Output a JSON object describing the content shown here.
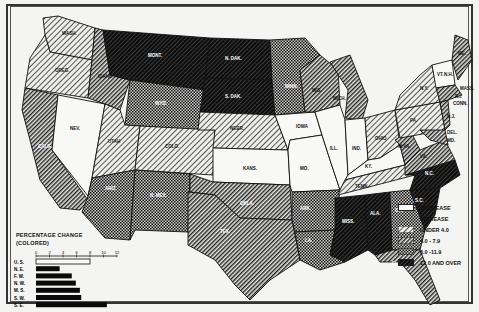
{
  "map": {
    "subject": "United States percentage change by state",
    "states": [
      {
        "abbr": "WASH.",
        "category": "under_4"
      },
      {
        "abbr": "OREG.",
        "category": "under_4"
      },
      {
        "abbr": "CALIF.",
        "category": "4_to_7.9"
      },
      {
        "abbr": "NEV.",
        "category": "decrease"
      },
      {
        "abbr": "IDAHO",
        "category": "4_to_7.9"
      },
      {
        "abbr": "MONT.",
        "category": "12_and_over"
      },
      {
        "abbr": "WYO.",
        "category": "8_to_11.9"
      },
      {
        "abbr": "UTAH",
        "category": "under_4"
      },
      {
        "abbr": "COLO.",
        "category": "under_4"
      },
      {
        "abbr": "ARIZ.",
        "category": "8_to_11.9"
      },
      {
        "abbr": "N. MEX.",
        "category": "8_to_11.9"
      },
      {
        "abbr": "N. DAK.",
        "category": "12_and_over"
      },
      {
        "abbr": "S. DAK.",
        "category": "12_and_over"
      },
      {
        "abbr": "NEBR.",
        "category": "under_4"
      },
      {
        "abbr": "KANS.",
        "category": "decrease"
      },
      {
        "abbr": "OKLA.",
        "category": "4_to_7.9"
      },
      {
        "abbr": "TEX.",
        "category": "4_to_7.9"
      },
      {
        "abbr": "MINN.",
        "category": "8_to_11.9"
      },
      {
        "abbr": "IOWA",
        "category": "decrease"
      },
      {
        "abbr": "MO.",
        "category": "decrease"
      },
      {
        "abbr": "ARK.",
        "category": "8_to_11.9"
      },
      {
        "abbr": "LA.",
        "category": "8_to_11.9"
      },
      {
        "abbr": "WIS.",
        "category": "4_to_7.9"
      },
      {
        "abbr": "ILL.",
        "category": "decrease"
      },
      {
        "abbr": "MICH.",
        "category": "4_to_7.9"
      },
      {
        "abbr": "IND.",
        "category": "decrease"
      },
      {
        "abbr": "OHIO",
        "category": "under_4"
      },
      {
        "abbr": "KY.",
        "category": "decrease"
      },
      {
        "abbr": "TENN.",
        "category": "under_4"
      },
      {
        "abbr": "MISS.",
        "category": "12_and_over"
      },
      {
        "abbr": "ALA.",
        "category": "12_and_over"
      },
      {
        "abbr": "GA.",
        "category": "8_to_11.9"
      },
      {
        "abbr": "FLA.",
        "category": "4_to_7.9"
      },
      {
        "abbr": "S.C.",
        "category": "12_and_over"
      },
      {
        "abbr": "N.C.",
        "category": "12_and_over"
      },
      {
        "abbr": "VA.",
        "category": "4_to_7.9"
      },
      {
        "abbr": "W. VA.",
        "category": "4_to_7.9"
      },
      {
        "abbr": "PA.",
        "category": "under_4"
      },
      {
        "abbr": "N.Y.",
        "category": "under_4"
      },
      {
        "abbr": "N.J.",
        "category": "4_to_7.9"
      },
      {
        "abbr": "DEL.",
        "category": "4_to_7.9"
      },
      {
        "abbr": "MD.",
        "category": "4_to_7.9"
      },
      {
        "abbr": "VT.",
        "category": "decrease"
      },
      {
        "abbr": "N.H.",
        "category": "decrease"
      },
      {
        "abbr": "MAINE",
        "category": "4_to_7.9"
      },
      {
        "abbr": "MASS.",
        "category": "4_to_7.9"
      },
      {
        "abbr": "R.I.",
        "category": "4_to_7.9"
      },
      {
        "abbr": "CONN.",
        "category": "4_to_7.9"
      }
    ]
  },
  "legend": {
    "items": [
      {
        "key": "decrease",
        "label": "DECREASE"
      },
      {
        "key": "increase_header",
        "label": "INCREASE"
      },
      {
        "key": "under_4",
        "label": "UNDER 4.0"
      },
      {
        "key": "4_to_7.9",
        "label": "4.0 - 7.9"
      },
      {
        "key": "8_to_11.9",
        "label": "8.0 -11.9"
      },
      {
        "key": "12_and_over",
        "label": "12.0 AND OVER"
      }
    ]
  },
  "chart_data": {
    "type": "bar",
    "orientation": "horizontal",
    "title": "PERCENTAGE CHANGE",
    "subtitle": "(COLORED)",
    "categories": [
      "U. S.",
      "N. E.",
      "F. W.",
      "N. W.",
      "M. S.",
      "S. W.",
      "S. E."
    ],
    "values": [
      8.0,
      3.5,
      5.3,
      5.9,
      6.5,
      6.7,
      10.5
    ],
    "xlabel": "",
    "ylabel": "",
    "xticks": [
      0,
      2,
      4,
      6,
      8,
      10,
      12
    ],
    "xlim": [
      0,
      12
    ]
  },
  "colors": {
    "background": "#f4f4f2",
    "ink": "#111111",
    "decrease": "#f8f8f6"
  }
}
